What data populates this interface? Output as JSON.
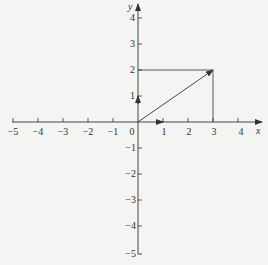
{
  "diagram": {
    "type": "cartesian-vector-plot",
    "x_axis_label": "x",
    "y_axis_label": "y",
    "x_ticks": [
      "−5",
      "−4",
      "−3",
      "−2",
      "−1",
      "0",
      "1",
      "2",
      "3",
      "4"
    ],
    "y_ticks_pos": [
      "1",
      "2",
      "3",
      "4"
    ],
    "y_ticks_neg": [
      "−1",
      "−2",
      "−3",
      "−4",
      "−5"
    ],
    "vector": {
      "from": [
        0,
        0
      ],
      "to": [
        3,
        2
      ]
    },
    "unit_vectors": [
      {
        "name": "i",
        "to": [
          1,
          0
        ]
      },
      {
        "name": "j",
        "to": [
          0,
          1
        ]
      }
    ],
    "guide_lines": [
      {
        "from": [
          0,
          2
        ],
        "to": [
          3,
          2
        ]
      },
      {
        "from": [
          3,
          0
        ],
        "to": [
          3,
          2
        ]
      }
    ],
    "colors": {
      "line": "#333333",
      "background": "#f4f4f2"
    }
  }
}
